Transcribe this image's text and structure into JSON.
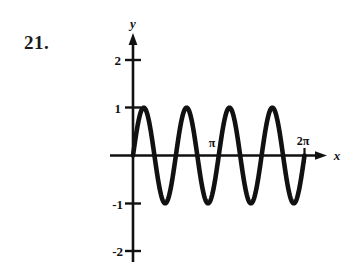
{
  "problem": {
    "number": "21."
  },
  "figure": {
    "name": "sine-graph",
    "axis_labels": {
      "x": "x",
      "y": "y"
    },
    "y_ticks": [
      {
        "label": "2",
        "value": 2
      },
      {
        "label": "1",
        "value": 1
      },
      {
        "label": "-1",
        "value": -1
      },
      {
        "label": "-2",
        "value": -2
      }
    ],
    "x_ticks": [
      {
        "label": "π",
        "value": 3.14159
      },
      {
        "label": "2π",
        "value": 6.28319
      }
    ],
    "curve_color": "#111111",
    "axis_color": "#111111"
  },
  "chart_data": {
    "type": "line",
    "title": "",
    "xlabel": "x",
    "ylabel": "y",
    "xlim": [
      0,
      6.28319
    ],
    "ylim": [
      -2.4,
      2.4
    ],
    "grid": false,
    "legend": "none",
    "function": "y = sin(4x)",
    "amplitude": 1,
    "period": 1.5708,
    "cycles_shown": 4,
    "x_tick_labels": [
      "π",
      "2π"
    ],
    "x_tick_values": [
      3.14159,
      6.28319
    ],
    "y_tick_labels": [
      "2",
      "1",
      "-1",
      "-2"
    ],
    "y_tick_values": [
      2,
      1,
      -1,
      -2
    ],
    "series": [
      {
        "name": "sin(4x)",
        "x": [
          0,
          0.19635,
          0.3927,
          0.58905,
          0.7854,
          0.98175,
          1.1781,
          1.37445,
          1.5708,
          1.76715,
          1.9635,
          2.15984,
          2.35619,
          2.55254,
          2.74889,
          2.94524,
          3.14159,
          3.33794,
          3.53429,
          3.73064,
          3.92699,
          4.12334,
          4.31969,
          4.51604,
          4.71239,
          4.90874,
          5.10509,
          5.30144,
          5.49779,
          5.69414,
          5.89049,
          6.08684,
          6.28319
        ],
        "y": [
          0,
          0.7071,
          1,
          0.7071,
          0,
          -0.7071,
          -1,
          -0.7071,
          0,
          0.7071,
          1,
          0.7071,
          0,
          -0.7071,
          -1,
          -0.7071,
          0,
          0.7071,
          1,
          0.7071,
          0,
          -0.7071,
          -1,
          -0.7071,
          0,
          0.7071,
          1,
          0.7071,
          0,
          -0.7071,
          -1,
          -0.7071,
          0
        ]
      }
    ]
  }
}
